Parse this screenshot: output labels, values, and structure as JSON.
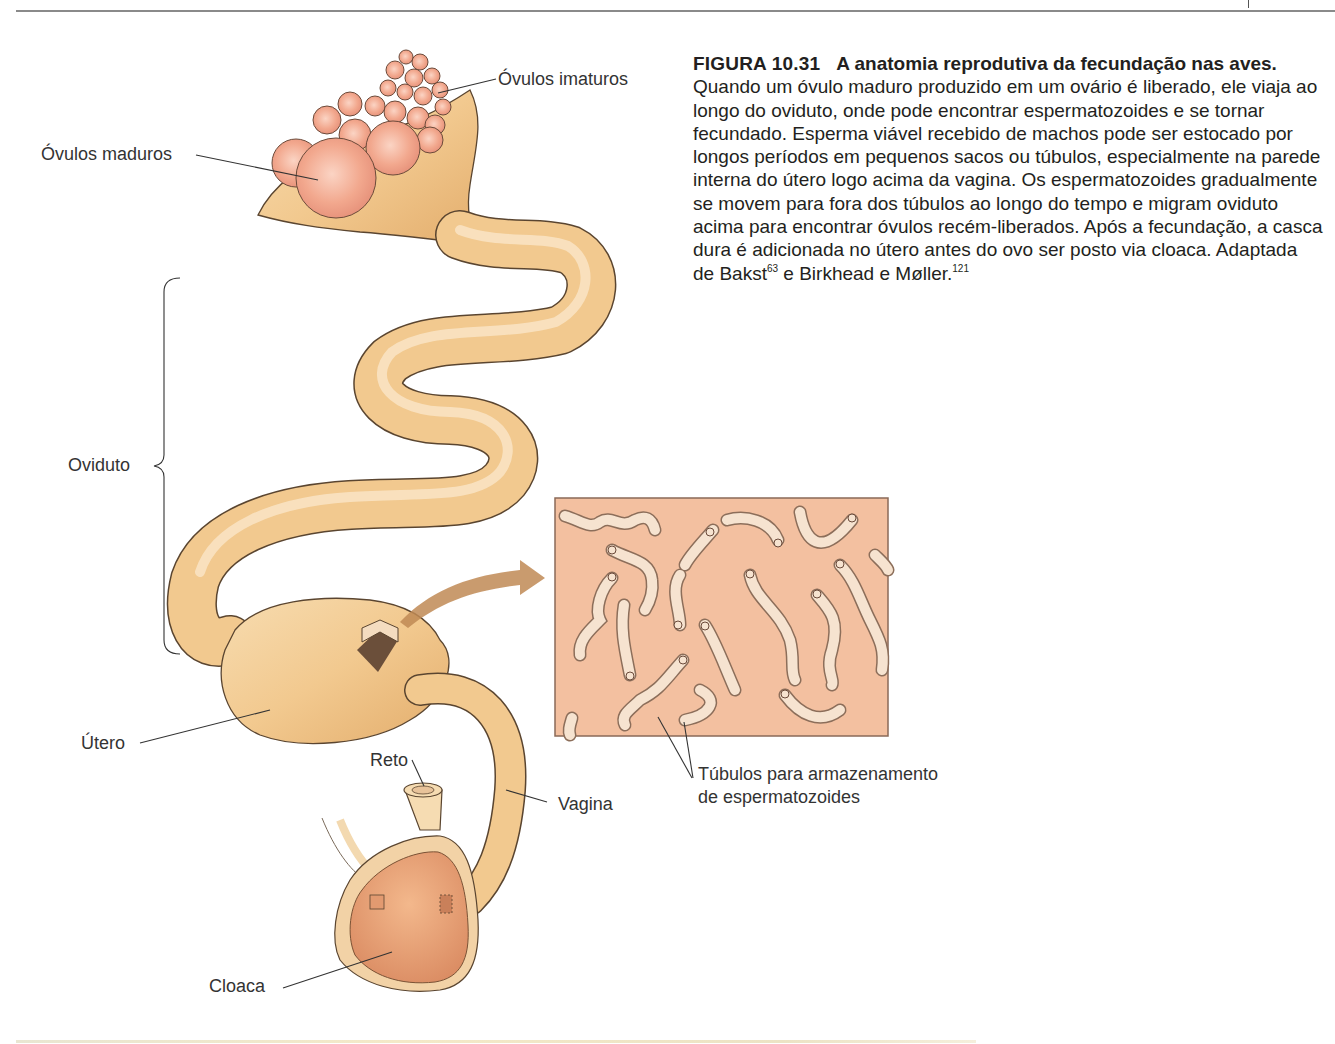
{
  "figure": {
    "number": "FIGURA 10.31",
    "title": "A anatomia reprodutiva da fecundação nas aves.",
    "caption_body": " Quando um óvulo maduro produzido em um ovário é liberado, ele viaja ao longo do oviduto, onde pode encontrar espermatozoides e se tornar fecundado. Esperma viável recebido de machos pode ser estocado por longos períodos em pequenos sacos ou túbulos, especialmente na parede interna do útero logo acima da vagina. Os espermatozoides gradualmente se movem para fora dos túbulos ao longo do tempo e migram oviduto acima para encontrar óvulos recém-liberados. Após a fecundação, a casca dura é adicionada no útero antes do ovo ser posto via cloaca. Adaptada de Bakst",
    "ref1": "63",
    "caption_mid": " e Birkhead e Møller.",
    "ref2": "121"
  },
  "labels": {
    "ovulos_imaturos": "Óvulos imaturos",
    "ovulos_maduros": "Óvulos maduros",
    "oviduto": "Oviduto",
    "utero": "Útero",
    "reto": "Reto",
    "vagina": "Vagina",
    "cloaca": "Cloaca",
    "tubulos_line1": "Túbulos para armazenamento",
    "tubulos_line2": "de espermatozoides"
  },
  "colors": {
    "tissue": "#f2c98f",
    "tissue_dark": "#d9a35f",
    "ovum": "#f0a890",
    "inset_bg": "#f3c0a0",
    "tubule": "#f6e3d0",
    "outline": "#5a4530",
    "arrow": "#c08a55"
  }
}
